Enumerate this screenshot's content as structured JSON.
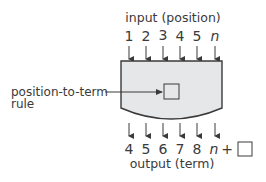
{
  "diagram": {
    "input_label": "input (position)",
    "output_label": "output (term)",
    "inputs": [
      "1",
      "2",
      "3",
      "4",
      "5",
      "n"
    ],
    "outputs": [
      "4",
      "5",
      "6",
      "7",
      "8",
      "n"
    ],
    "output_expression_suffix": "+",
    "rule_label_line1": "position-to-term",
    "rule_label_line2": "rule",
    "colors": {
      "machine_fill": "#e6e7e8",
      "stroke": "#3a3a3a",
      "text": "#3a3a3a"
    }
  }
}
